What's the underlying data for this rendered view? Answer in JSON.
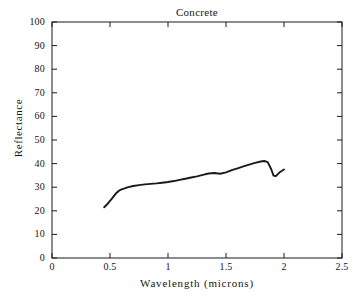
{
  "chart_data": {
    "type": "line",
    "title": "Concrete",
    "xlabel": "Wavelength (microns)",
    "ylabel": "Reflectance",
    "xlim": [
      0,
      2.5
    ],
    "ylim": [
      0,
      100
    ],
    "grid": false,
    "legend": "none",
    "xticks": [
      0,
      0.5,
      1,
      1.5,
      2,
      2.5
    ],
    "xtick_labels": [
      "0",
      "0.5",
      "1",
      "1.5",
      "2",
      "2.5"
    ],
    "yticks": [
      0,
      10,
      20,
      30,
      40,
      50,
      60,
      70,
      80,
      90,
      100
    ],
    "ytick_labels": [
      "0",
      "10",
      "20",
      "30",
      "40",
      "50",
      "60",
      "70",
      "80",
      "90",
      "100"
    ],
    "series": [
      {
        "name": "Concrete",
        "color": "#1a1a1a",
        "x": [
          0.45,
          0.48,
          0.52,
          0.55,
          0.58,
          0.6,
          0.62,
          0.65,
          0.7,
          0.75,
          0.8,
          0.85,
          0.9,
          0.95,
          1.0,
          1.05,
          1.1,
          1.15,
          1.2,
          1.25,
          1.3,
          1.35,
          1.4,
          1.45,
          1.5,
          1.55,
          1.6,
          1.65,
          1.7,
          1.75,
          1.8,
          1.83,
          1.86,
          1.89,
          1.91,
          1.93,
          1.96,
          2.0
        ],
        "y": [
          21.5,
          23.0,
          25.4,
          27.3,
          28.6,
          29.1,
          29.4,
          29.9,
          30.5,
          30.9,
          31.2,
          31.4,
          31.6,
          31.9,
          32.2,
          32.6,
          33.1,
          33.6,
          34.1,
          34.6,
          35.2,
          35.8,
          36.0,
          35.7,
          36.3,
          37.2,
          38.0,
          38.8,
          39.6,
          40.3,
          40.9,
          41.1,
          40.6,
          37.6,
          34.9,
          34.7,
          36.2,
          37.5
        ]
      }
    ]
  }
}
